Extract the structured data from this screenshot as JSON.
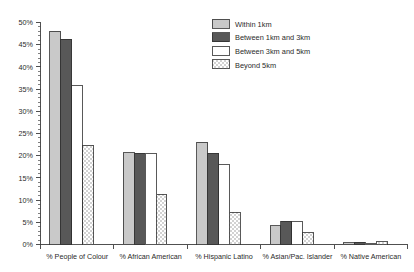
{
  "chart_data": {
    "type": "bar",
    "title": "",
    "xlabel": "",
    "ylabel": "",
    "ylim": [
      0,
      50
    ],
    "ytick_values": [
      0,
      5,
      10,
      15,
      20,
      25,
      30,
      35,
      40,
      45,
      50
    ],
    "ytick_labels": [
      "0%",
      "5%",
      "10%",
      "15%",
      "20%",
      "25%",
      "30%",
      "35%",
      "40%",
      "45%",
      "50%"
    ],
    "minor_tick_step": 1,
    "grid": false,
    "legend_position": "top-right",
    "categories": [
      "% People of Colour",
      "% African American",
      "% Hispanic Latino",
      "% Asian/Pac. Islander",
      "% Native American"
    ],
    "series": [
      {
        "name": "Within 1km",
        "color": "#c9c9c9",
        "pattern": "solid",
        "values": [
          48.0,
          20.7,
          23.0,
          4.2,
          0.4
        ]
      },
      {
        "name": "Between 1km and 3km",
        "color": "#585858",
        "pattern": "solid",
        "values": [
          46.2,
          20.5,
          20.6,
          5.2,
          0.5
        ]
      },
      {
        "name": "Between 3km and 5km",
        "color": "#ffffff",
        "pattern": "solid",
        "values": [
          35.8,
          20.6,
          18.0,
          5.1,
          0.3
        ]
      },
      {
        "name": "Beyond 5km",
        "color": "#ffffff",
        "pattern": "dots",
        "values": [
          22.3,
          11.3,
          7.3,
          2.6,
          0.6
        ]
      }
    ]
  },
  "legend": {
    "items": [
      {
        "label": "Within 1km"
      },
      {
        "label": "Between 1km and 3km"
      },
      {
        "label": "Between 3km and 5km"
      },
      {
        "label": "Beyond 5km"
      }
    ]
  },
  "axis": {
    "y_labels": [
      "50%",
      "45%",
      "40%",
      "35%",
      "30%",
      "25%",
      "20%",
      "15%",
      "10%",
      "5%",
      "0%"
    ],
    "x_labels": [
      "% People of Colour",
      "% African American",
      "% Hispanic Latino",
      "% Asian/Pac. Islander",
      "% Native American"
    ]
  },
  "colors": {
    "series_1": "#c9c9c9",
    "series_2": "#585858",
    "series_3": "#ffffff",
    "series_4": "#ffffff",
    "axis": "#3d3d3d",
    "text": "#2a2a2a",
    "background": "#ffffff"
  }
}
